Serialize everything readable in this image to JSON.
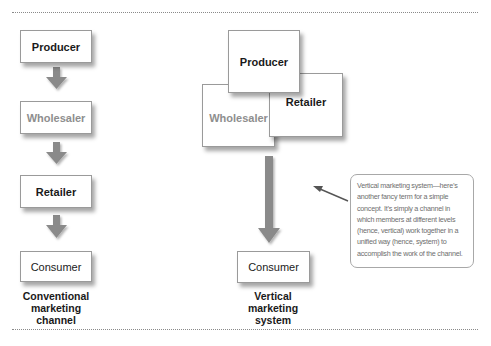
{
  "diagram": {
    "conventional": {
      "nodes": [
        {
          "id": "producer",
          "label": "Producer",
          "style": "bold"
        },
        {
          "id": "wholesaler",
          "label": "Wholesaler",
          "style": "faded"
        },
        {
          "id": "retailer",
          "label": "Retailer",
          "style": "bold"
        },
        {
          "id": "consumer",
          "label": "Consumer",
          "style": "plain"
        }
      ],
      "caption": [
        "Conventional",
        "marketing",
        "channel"
      ]
    },
    "vertical": {
      "nodes": [
        {
          "id": "producer",
          "label": "Producer",
          "style": "bold"
        },
        {
          "id": "wholesaler",
          "label": "Wholesaler",
          "style": "faded"
        },
        {
          "id": "retailer",
          "label": "Retailer",
          "style": "bold"
        },
        {
          "id": "consumer",
          "label": "Consumer",
          "style": "plain"
        }
      ],
      "caption": [
        "Vertical",
        "marketing",
        "system"
      ]
    },
    "callout": {
      "lines": [
        "Vertical marketing system—here’s",
        "another fancy term for a simple",
        "concept. It’s simply a channel in",
        "which members at different levels",
        "(hence, vertical) work together in a",
        "unified way (hence, system) to",
        "accomplish the work of the channel."
      ]
    },
    "colors": {
      "arrow": "#8a8a8a",
      "box_border": "#9a9a9a",
      "faded_text": "#8e8e8e",
      "callout_text": "#6e6e6e",
      "rule": "#8a8a8a"
    }
  }
}
